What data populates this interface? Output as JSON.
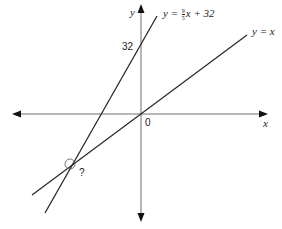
{
  "diagram": {
    "type": "coordinate-plane",
    "axes": {
      "x_label": "x",
      "y_label": "y",
      "origin_label": "0"
    },
    "tick_labels": {
      "y_intercept": "32"
    },
    "lines": [
      {
        "name": "celsius-to-fahrenheit",
        "label_prefix": "y = ",
        "fraction_num": "9",
        "fraction_den": "5",
        "label_suffix": "x + 32",
        "slope": 1.8,
        "intercept": 32
      },
      {
        "name": "identity",
        "label": "y = x",
        "slope": 1,
        "intercept": 0
      }
    ],
    "intersection": {
      "label": "?",
      "marked_with_circle": true
    },
    "colors": {
      "axis": "#6e6e6e",
      "line": "#2a2a2a",
      "text": "#222222"
    }
  }
}
